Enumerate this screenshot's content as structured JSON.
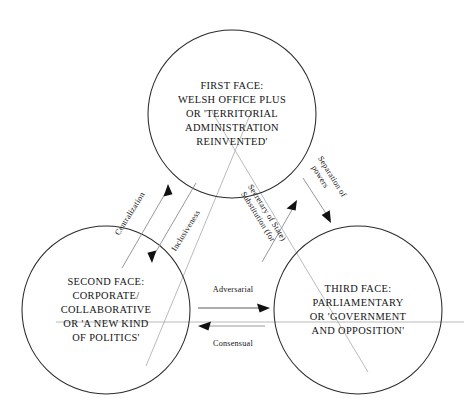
{
  "diagram": {
    "type": "venn-triangle-relationship",
    "background_color": "#ffffff",
    "node_text_color": "#141414",
    "circle_stroke_color": "#2b2b2b",
    "arrow_color": "#111111",
    "guide_line_color": "#a8a8a8",
    "nodes": [
      {
        "id": "first-face",
        "position": "top",
        "center_x": 232,
        "center_y": 114,
        "radius": 84,
        "lines": [
          "FIRST FACE:",
          "WELSH OFFICE PLUS",
          "OR 'TERRITORIAL",
          "ADMINISTRATION",
          "REINVENTED'"
        ]
      },
      {
        "id": "second-face",
        "position": "bottom-left",
        "center_x": 106,
        "center_y": 310,
        "radius": 84,
        "lines": [
          "SECOND FACE:",
          "CORPORATE/",
          "COLLABORATIVE",
          "OR 'A NEW KIND",
          "OF POLITICS'"
        ]
      },
      {
        "id": "third-face",
        "position": "bottom-right",
        "center_x": 358,
        "center_y": 310,
        "radius": 84,
        "lines": [
          "THIRD FACE:",
          "PARLIAMENTARY",
          "OR 'GOVERNMENT",
          "AND OPPOSITION'"
        ]
      }
    ],
    "edges": [
      {
        "id": "centralization",
        "label": "Centralization",
        "from": "second-face",
        "to": "first-face",
        "direction": "up-right",
        "rotation_deg": -57
      },
      {
        "id": "inclusiveness",
        "label": "Inclusiveness",
        "from": "first-face",
        "to": "second-face",
        "direction": "down-left",
        "rotation_deg": -57
      },
      {
        "id": "substitution",
        "label": "Substitution (for Secretary of State)",
        "label_line_1": "Substitution (for",
        "label_line_2": "Secretary of State)",
        "from": "third-face",
        "to": "first-face",
        "direction": "up-left",
        "rotation_deg": 57
      },
      {
        "id": "separation-of-powers",
        "label": "Separation of powers",
        "label_line_1": "Separation of",
        "label_line_2": "powers",
        "from": "first-face",
        "to": "third-face",
        "direction": "down-right",
        "rotation_deg": 57
      },
      {
        "id": "adversarial",
        "label": "Adversarial",
        "from": "second-face",
        "to": "third-face",
        "direction": "right",
        "rotation_deg": 0
      },
      {
        "id": "consensual",
        "label": "Consensual",
        "from": "third-face",
        "to": "second-face",
        "direction": "left",
        "rotation_deg": 0
      }
    ]
  }
}
